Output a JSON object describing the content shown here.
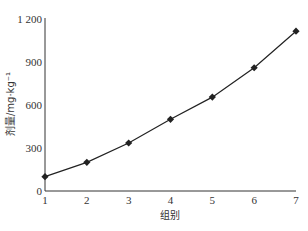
{
  "chart_data": {
    "type": "line",
    "title": "",
    "xlabel": "组别",
    "ylabel": "剂量/mg·kg⁻¹",
    "x": [
      1,
      2,
      3,
      4,
      5,
      6,
      7
    ],
    "categories": [
      "1",
      "2",
      "3",
      "4",
      "5",
      "6",
      "7"
    ],
    "series": [
      {
        "name": "剂量",
        "values": [
          100,
          200,
          335,
          500,
          655,
          860,
          1115
        ],
        "marker": "diamond",
        "color": "#222222"
      }
    ],
    "ylim": [
      0,
      1200
    ],
    "xlim": [
      1,
      7
    ],
    "yticks": [
      0,
      300,
      600,
      900,
      1200
    ],
    "ytick_labels": [
      "0",
      "300",
      "600",
      "900",
      "1 200"
    ],
    "xticks": [
      1,
      2,
      3,
      4,
      5,
      6,
      7
    ],
    "grid": false,
    "legend": "none"
  }
}
